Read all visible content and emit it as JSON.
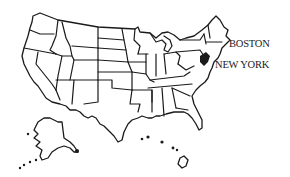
{
  "map": {
    "title": "United States",
    "style": {
      "outline_color": "#1a1a1a",
      "fill_color": "#ffffff",
      "background": "#ffffff"
    },
    "labels": [
      {
        "id": "boston",
        "text": "BOSTON",
        "x": 229,
        "y": 38
      },
      {
        "id": "new-york",
        "text": "NEW YORK",
        "x": 215,
        "y": 59
      }
    ],
    "regions": [
      "contiguous-us",
      "alaska",
      "hawaii"
    ]
  }
}
